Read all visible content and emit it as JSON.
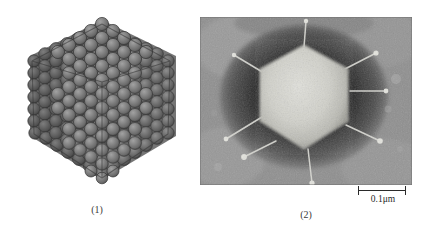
{
  "figure": {
    "background_color": "#ffffff",
    "panels": [
      {
        "id": "model",
        "caption": "(1)",
        "kind": "icosahedral-capsid-model",
        "description": "Three-dimensional model of an icosahedral virus capsid built from closely packed spherical capsomers",
        "capsomer_color": "#7b7b7b",
        "capsomer_outline_color": "#3c3c3c",
        "capsomer_highlight_color": "#9b9b9b",
        "capsomer_shadow_color": "#555555",
        "facets_visible": 3
      },
      {
        "id": "micrograph",
        "caption": "(2)",
        "kind": "electron-micrograph",
        "description": "Negative-stain transmission electron micrograph of a single hexagonal virus particle with radiating fibres",
        "particle_color": "#d8d8d2",
        "stain_color": "#2b2b2b",
        "field_color": "#8f8f8f",
        "fiber_count": 8,
        "scalebar": {
          "label": "0.1μm",
          "length_px": 48,
          "tick_color": "#2a2a2a"
        }
      }
    ]
  }
}
